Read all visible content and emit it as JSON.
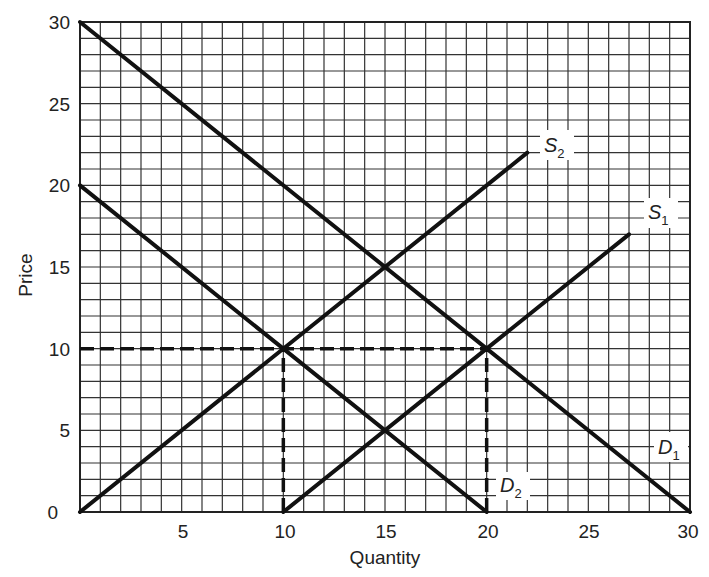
{
  "chart_data": {
    "type": "line",
    "title": "",
    "xlabel": "Quantity",
    "ylabel": "Price",
    "xlim": [
      0,
      30
    ],
    "ylim": [
      0,
      30
    ],
    "grid": true,
    "grid_step": 1,
    "x_ticks": [
      5,
      10,
      15,
      20,
      25,
      30
    ],
    "y_ticks": [
      0,
      5,
      10,
      15,
      20,
      25,
      30
    ],
    "series": [
      {
        "name": "D1",
        "label": "D",
        "subscript": "1",
        "points": [
          [
            0,
            30
          ],
          [
            30,
            0
          ]
        ]
      },
      {
        "name": "D2",
        "label": "D",
        "subscript": "2",
        "points": [
          [
            0,
            20
          ],
          [
            20,
            0
          ]
        ]
      },
      {
        "name": "S1",
        "label": "S",
        "subscript": "1",
        "points": [
          [
            10,
            0
          ],
          [
            27,
            17
          ]
        ]
      },
      {
        "name": "S2",
        "label": "S",
        "subscript": "2",
        "points": [
          [
            0,
            0
          ],
          [
            22,
            22
          ]
        ]
      }
    ],
    "reference_lines": [
      {
        "type": "horizontal",
        "y": 10,
        "from_x": 0,
        "to_x": 20,
        "style": "dashed"
      },
      {
        "type": "vertical",
        "x": 10,
        "from_y": 0,
        "to_y": 10,
        "style": "dashed"
      },
      {
        "type": "vertical",
        "x": 20,
        "from_y": 0,
        "to_y": 10,
        "style": "dashed"
      }
    ],
    "intersections": [
      [
        10,
        10
      ],
      [
        15,
        15
      ],
      [
        15,
        5
      ],
      [
        20,
        10
      ]
    ]
  },
  "labels": {
    "y0": "0",
    "y5": "5",
    "y10": "10",
    "y15": "15",
    "y20": "20",
    "y25": "25",
    "y30": "30",
    "x5": "5",
    "x10": "10",
    "x15": "15",
    "x20": "20",
    "x25": "25",
    "x30": "30",
    "xlabel": "Quantity",
    "ylabel": "Price",
    "S": "S",
    "D": "D",
    "sub1": "1",
    "sub2": "2"
  }
}
